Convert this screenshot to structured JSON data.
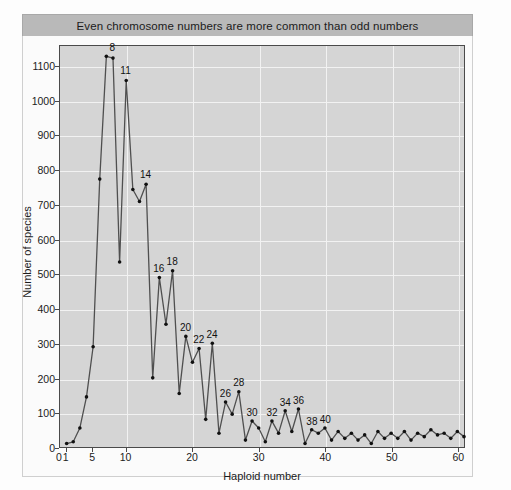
{
  "figure": {
    "title": "Even chromosome numbers are more common than odd numbers"
  },
  "axes": {
    "xlabel": "Haploid number",
    "ylabel": "Number of species",
    "xticks": [
      0,
      1,
      5,
      10,
      20,
      30,
      40,
      50,
      60
    ],
    "yticks": [
      0,
      100,
      200,
      300,
      400,
      500,
      600,
      700,
      800,
      900,
      1000,
      1100
    ],
    "xlim": [
      0,
      61
    ],
    "ylim": [
      0,
      1160
    ]
  },
  "colors": {
    "title_band": "#b9b9b9",
    "plot_background": "#d5d5d5",
    "gridline": "#f2f2f2",
    "line": "#4f4f4f",
    "marker": "#111111",
    "frame": "#4a4a4a"
  },
  "chart_data": {
    "type": "line",
    "title": "Even chromosome numbers are more common than odd numbers",
    "xlabel": "Haploid number",
    "ylabel": "Number of species",
    "xlim": [
      0,
      61
    ],
    "ylim": [
      0,
      1160
    ],
    "grid": true,
    "legend": "none",
    "x": [
      1,
      2,
      3,
      4,
      5,
      6,
      7,
      8,
      9,
      10,
      11,
      12,
      13,
      14,
      15,
      16,
      17,
      18,
      19,
      20,
      21,
      22,
      23,
      24,
      25,
      26,
      27,
      28,
      29,
      30,
      31,
      32,
      33,
      34,
      35,
      36,
      37,
      38,
      39,
      40,
      41,
      42,
      43,
      44,
      45,
      46,
      47,
      48,
      49,
      50,
      51,
      52,
      53,
      54,
      55,
      56,
      57,
      58,
      59,
      60,
      61
    ],
    "values": [
      10,
      15,
      55,
      145,
      290,
      775,
      1130,
      1125,
      535,
      1060,
      745,
      710,
      760,
      200,
      490,
      355,
      510,
      155,
      320,
      245,
      285,
      80,
      300,
      40,
      130,
      95,
      160,
      20,
      75,
      55,
      15,
      75,
      40,
      105,
      45,
      110,
      10,
      50,
      40,
      55,
      20,
      45,
      25,
      40,
      20,
      35,
      10,
      45,
      25,
      40,
      25,
      45,
      20,
      40,
      30,
      50,
      35,
      40,
      25,
      45,
      30
    ],
    "annotations": [
      {
        "x": 8,
        "label": "8"
      },
      {
        "x": 10,
        "label": "11"
      },
      {
        "x": 13,
        "label": "14"
      },
      {
        "x": 15,
        "label": "16"
      },
      {
        "x": 17,
        "label": "18"
      },
      {
        "x": 19,
        "label": "20"
      },
      {
        "x": 21,
        "label": "22"
      },
      {
        "x": 23,
        "label": "24"
      },
      {
        "x": 25,
        "label": "26"
      },
      {
        "x": 27,
        "label": "28"
      },
      {
        "x": 29,
        "label": "30"
      },
      {
        "x": 32,
        "label": "32"
      },
      {
        "x": 34,
        "label": "34"
      },
      {
        "x": 36,
        "label": "36"
      },
      {
        "x": 38,
        "label": "38"
      },
      {
        "x": 40,
        "label": "40"
      }
    ]
  }
}
